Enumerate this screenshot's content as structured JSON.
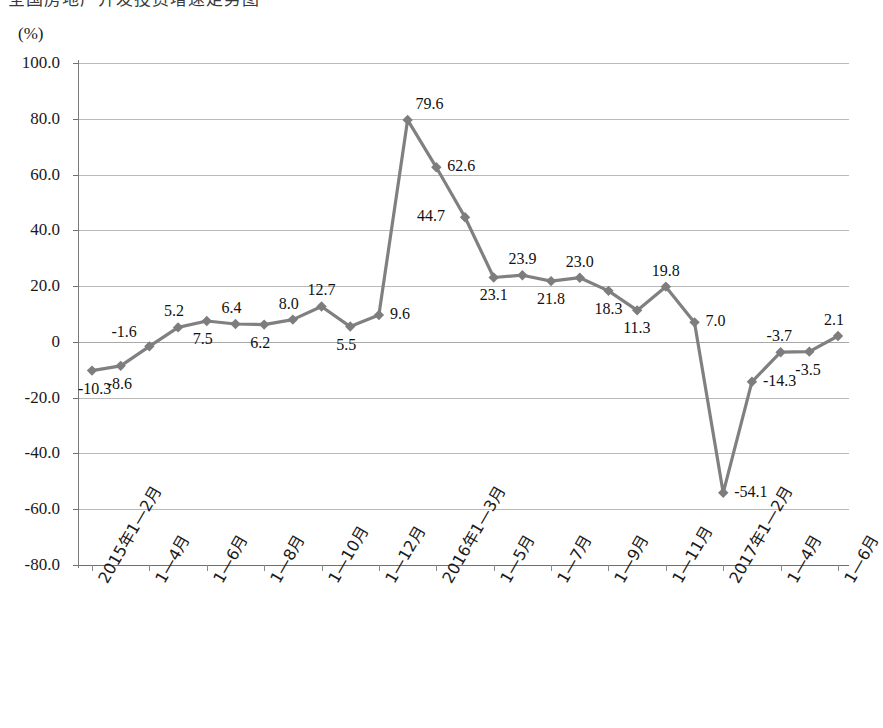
{
  "caption": {
    "clipped_heading": "全国房地产开发投资增速走势图"
  },
  "axes": {
    "unit_label": "(%)",
    "y_ticks": [
      "100.0",
      "80.0",
      "60.0",
      "40.0",
      "20.0",
      "0",
      "-20.0",
      "-40.0",
      "-60.0",
      "-80.0"
    ],
    "y_tick_values": [
      100,
      80,
      60,
      40,
      20,
      0,
      -20,
      -40,
      -60,
      -80
    ],
    "x_labels": [
      "2015年1—2月",
      "1—4月",
      "1—6月",
      "1—8月",
      "1—10月",
      "1—12月",
      "2016年1—3月",
      "1—5月",
      "1—7月",
      "1—9月",
      "1—11月",
      "2017年1—2月",
      "1—4月",
      "1—6月"
    ]
  },
  "style": {
    "line_color": "#808080",
    "marker_color": "#7d7d7d",
    "grid_color": "#b9b9b9",
    "axis_color": "#7a7a7a",
    "text_color": "#1a1a1a"
  },
  "chart_data": {
    "type": "line",
    "title": "",
    "subtitle": "",
    "xlabel": "",
    "ylabel": "(%)",
    "ylim": [
      -80,
      100
    ],
    "grid": true,
    "legend": "none",
    "categories": [
      "2015年1—2月",
      "2015年1—3月",
      "2015年1—4月",
      "2015年1—5月",
      "2015年1—6月",
      "2015年1—7月",
      "2015年1—8月",
      "2015年1—9月",
      "2015年1—10月",
      "2015年1—11月",
      "2015年1—12月",
      "2016年1—2月",
      "2016年1—3月",
      "2016年1—4月",
      "2016年1—5月",
      "2016年1—6月",
      "2016年1—7月",
      "2016年1—8月",
      "2016年1—9月",
      "2016年1—10月",
      "2016年1—11月",
      "2016年1—12月",
      "2017年1—2月",
      "2017年1—3月",
      "2017年1—4月",
      "2017年1—5月",
      "2017年1—6月"
    ],
    "values": [
      -10.3,
      -8.6,
      -1.6,
      5.2,
      7.5,
      6.4,
      6.2,
      8.0,
      12.7,
      5.5,
      9.6,
      79.6,
      62.6,
      44.7,
      23.1,
      23.9,
      21.8,
      23.0,
      18.3,
      11.3,
      19.8,
      7.0,
      -54.1,
      -14.3,
      -3.7,
      -3.5,
      2.1
    ],
    "point_labels": [
      {
        "value": -10.3,
        "text": "-10.3",
        "pos": "below"
      },
      {
        "value": -8.6,
        "text": "-8.6",
        "pos": "below"
      },
      {
        "value": -1.6,
        "text": "-1.6",
        "pos": "above-left"
      },
      {
        "value": 5.2,
        "text": "5.2",
        "pos": "above"
      },
      {
        "value": 7.5,
        "text": "7.5",
        "pos": "below"
      },
      {
        "value": 6.4,
        "text": "6.4",
        "pos": "above"
      },
      {
        "value": 6.2,
        "text": "6.2",
        "pos": "below"
      },
      {
        "value": 8.0,
        "text": "8.0",
        "pos": "above"
      },
      {
        "value": 12.7,
        "text": "12.7",
        "pos": "above"
      },
      {
        "value": 5.5,
        "text": "5.5",
        "pos": "below"
      },
      {
        "value": 9.6,
        "text": "9.6",
        "pos": "right"
      },
      {
        "value": 79.6,
        "text": "79.6",
        "pos": "above-right"
      },
      {
        "value": 62.6,
        "text": "62.6",
        "pos": "right"
      },
      {
        "value": 44.7,
        "text": "44.7",
        "pos": "left"
      },
      {
        "value": 23.1,
        "text": "23.1",
        "pos": "below"
      },
      {
        "value": 23.9,
        "text": "23.9",
        "pos": "above"
      },
      {
        "value": 21.8,
        "text": "21.8",
        "pos": "below"
      },
      {
        "value": 23.0,
        "text": "23.0",
        "pos": "above"
      },
      {
        "value": 18.3,
        "text": "18.3",
        "pos": "below"
      },
      {
        "value": 11.3,
        "text": "11.3",
        "pos": "below"
      },
      {
        "value": 19.8,
        "text": "19.8",
        "pos": "above"
      },
      {
        "value": 7.0,
        "text": "7.0",
        "pos": "right"
      },
      {
        "value": -54.1,
        "text": "-54.1",
        "pos": "right"
      },
      {
        "value": -14.3,
        "text": "-14.3",
        "pos": "right"
      },
      {
        "value": -3.7,
        "text": "-3.7",
        "pos": "above"
      },
      {
        "value": -3.5,
        "text": "-3.5",
        "pos": "below"
      },
      {
        "value": 2.1,
        "text": "2.1",
        "pos": "above"
      }
    ]
  }
}
